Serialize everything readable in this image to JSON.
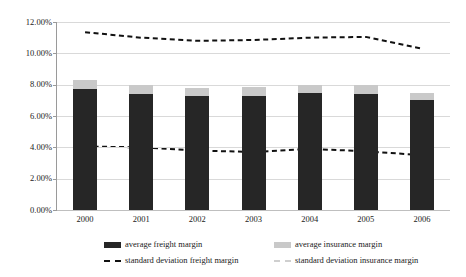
{
  "chart_data": {
    "type": "bar",
    "subtype": "stacked-bar-with-lines",
    "title": "",
    "subtitle": "",
    "xlabel": "",
    "ylabel": "",
    "categories": [
      "2000",
      "2001",
      "2002",
      "2003",
      "2004",
      "2005",
      "2006"
    ],
    "ylim": [
      0,
      12
    ],
    "y_tick_labels": [
      "0.00%",
      "2.00%",
      "4.00%",
      "6.00%",
      "8.00%",
      "10.00%",
      "12.00%"
    ],
    "y_tick_values": [
      0,
      2,
      4,
      6,
      8,
      10,
      12
    ],
    "y_unit": "%",
    "grid": true,
    "grid_axis": "y",
    "legend_position": "bottom",
    "legend_columns": 2,
    "series": [
      {
        "name": "average freight margin",
        "type": "bar",
        "stack": "margins",
        "color": "#262626",
        "values": [
          7.7,
          7.4,
          7.25,
          7.3,
          7.45,
          7.4,
          7.0
        ]
      },
      {
        "name": "average insurance margin",
        "type": "bar",
        "stack": "margins",
        "color": "#c9c9c9",
        "values": [
          0.6,
          0.55,
          0.55,
          0.55,
          0.55,
          0.55,
          0.45
        ]
      },
      {
        "name": "standard deviation freight margin",
        "type": "line",
        "style": "dashed",
        "color": "#111111",
        "values": [
          4.05,
          4.0,
          3.8,
          3.7,
          3.9,
          3.75,
          3.5
        ]
      },
      {
        "name": "standard deviation insurance margin",
        "type": "line",
        "style": "dashed",
        "color": "#111111",
        "values": [
          11.35,
          11.0,
          10.8,
          10.85,
          11.0,
          11.05,
          10.3
        ]
      }
    ]
  },
  "legend": {
    "items": [
      {
        "label": "average freight margin",
        "marker": "solid-dark-square"
      },
      {
        "label": "average insurance margin",
        "marker": "solid-light-square"
      },
      {
        "label": "standard deviation freight margin",
        "marker": "dashed-dark-line"
      },
      {
        "label": "standard deviation insurance margin",
        "marker": "dashed-light-line"
      }
    ]
  }
}
